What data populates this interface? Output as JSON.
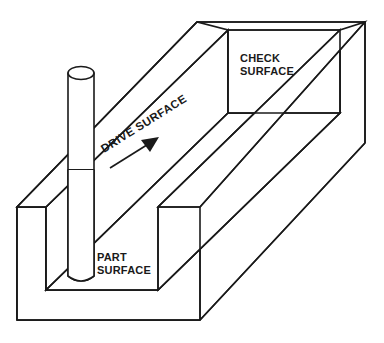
{
  "diagram": {
    "type": "engineering-line-drawing",
    "background_color": "#ffffff",
    "line_color": "#1a1a1a",
    "labels": {
      "check_surface_line1": "CHECK",
      "check_surface_line2": "SURFACE",
      "drive_surface": "DRIVE SURFACE",
      "part_surface_line1": "PART",
      "part_surface_line2": "SURFACE"
    },
    "annotations": {
      "drive_surface_rotation_deg": -32,
      "arrow_direction": "up-right",
      "arrow_meaning": "tool travel direction along drive surface"
    },
    "components": {
      "workpiece": "rectangular block with machined channel",
      "tool": "helical flute end mill cutter",
      "tool_shank": "smooth cylindrical shank",
      "tool_flutes": "helical cutting flutes"
    }
  }
}
